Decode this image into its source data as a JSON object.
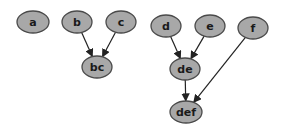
{
  "diagram": {
    "type": "directed-graph",
    "node_fill": "#a8a8a8",
    "node_stroke": "#4a4a4a",
    "edge_color": "#222222",
    "nodes": [
      {
        "id": "a",
        "label": "a",
        "cx": 33,
        "cy": 22,
        "rx": 16,
        "ry": 11
      },
      {
        "id": "b",
        "label": "b",
        "cx": 77,
        "cy": 22,
        "rx": 15,
        "ry": 11
      },
      {
        "id": "c",
        "label": "c",
        "cx": 121,
        "cy": 22,
        "rx": 15,
        "ry": 11
      },
      {
        "id": "bc",
        "label": "bc",
        "cx": 97,
        "cy": 67,
        "rx": 15,
        "ry": 11
      },
      {
        "id": "d",
        "label": "d",
        "cx": 166,
        "cy": 26,
        "rx": 15,
        "ry": 11
      },
      {
        "id": "e",
        "label": "e",
        "cx": 210,
        "cy": 26,
        "rx": 15,
        "ry": 11
      },
      {
        "id": "f",
        "label": "f",
        "cx": 253,
        "cy": 28,
        "rx": 15,
        "ry": 11
      },
      {
        "id": "de",
        "label": "de",
        "cx": 185,
        "cy": 69,
        "rx": 15,
        "ry": 11
      },
      {
        "id": "def",
        "label": "def",
        "cx": 186,
        "cy": 112,
        "rx": 16,
        "ry": 11
      }
    ],
    "edges": [
      {
        "from": "b",
        "to": "bc"
      },
      {
        "from": "c",
        "to": "bc"
      },
      {
        "from": "d",
        "to": "de"
      },
      {
        "from": "e",
        "to": "de"
      },
      {
        "from": "de",
        "to": "def"
      },
      {
        "from": "f",
        "to": "def"
      }
    ]
  }
}
